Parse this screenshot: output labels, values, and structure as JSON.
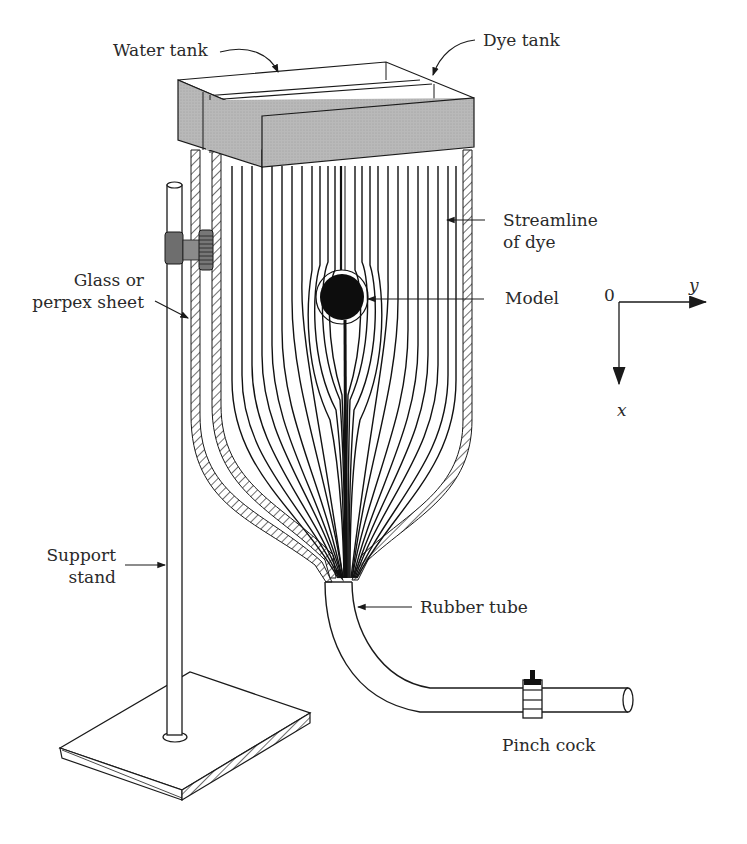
{
  "figure": {
    "labels": {
      "water_tank": "Water tank",
      "dye_tank": "Dye tank",
      "streamline_line1": "Streamline",
      "streamline_line2": "of dye",
      "model": "Model",
      "glass_line1": "Glass or",
      "glass_line2": "perpex sheet",
      "support_line1": "Support",
      "support_line2": "stand",
      "rubber_tube": "Rubber tube",
      "pinch_cock": "Pinch cock"
    },
    "axes": {
      "origin": "0",
      "horizontal": "y",
      "vertical": "x"
    },
    "colors": {
      "ink": "#1a1a1a",
      "tank_fill": "#b8b8b8",
      "clamp_fill": "#7a7a7a",
      "paper": "#ffffff"
    }
  }
}
